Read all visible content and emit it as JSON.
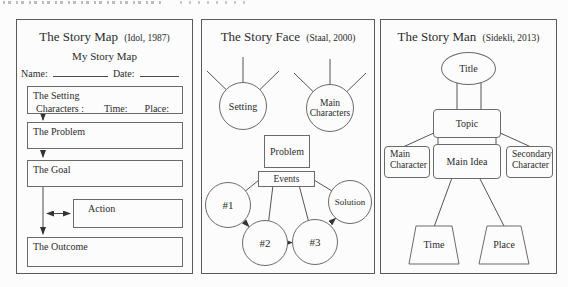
{
  "figure": {
    "background": "#fcfcfc",
    "line_color": "#555555",
    "text_color": "#2b2b2b"
  },
  "panels": {
    "story_map": {
      "title": "The Story Map",
      "citation": "(Idol, 1987)",
      "subtitle": "My Story Map",
      "name_label": "Name:",
      "date_label": "Date:",
      "setting_box": {
        "title": "The Setting",
        "fields": [
          "Characters :",
          "Time:",
          "Place:"
        ]
      },
      "problem_box": "The Problem",
      "goal_box": "The Goal",
      "action_box": "Action",
      "outcome_box": "The Outcome"
    },
    "story_face": {
      "title": "The Story Face",
      "citation": "(Staal, 2000)",
      "setting": "Setting",
      "main_characters": "Main Characters",
      "problem": "Problem",
      "events": "Events",
      "event_1": "#1",
      "event_2": "#2",
      "event_3": "#3",
      "solution": "Solution"
    },
    "story_man": {
      "title": "The Story Man",
      "citation": "(Sidekli, 2013)",
      "title_node": "Title",
      "topic": "Topic",
      "main_character": "Main Character",
      "main_idea": "Main Idea",
      "secondary_character": "Secondary Character",
      "time": "Time",
      "place": "Place"
    }
  }
}
